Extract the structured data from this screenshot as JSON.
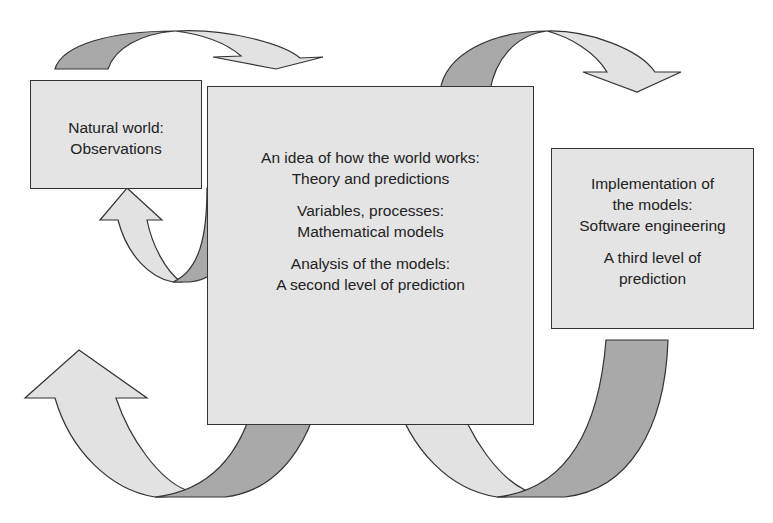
{
  "diagram": {
    "boxes": {
      "natural": {
        "lines": [
          "Natural world:",
          "Observations"
        ]
      },
      "theory": {
        "groups": [
          {
            "lines": [
              "An idea of how the world works:",
              "Theory and predictions"
            ]
          },
          {
            "lines": [
              "Variables, processes:",
              "Mathematical models"
            ]
          },
          {
            "lines": [
              "Analysis of the models:",
              "A second level of prediction"
            ]
          }
        ]
      },
      "implementation": {
        "groups": [
          {
            "lines": [
              "Implementation of",
              "the models:",
              "Software engineering"
            ]
          },
          {
            "lines": [
              "A third level of",
              "prediction"
            ]
          }
        ]
      }
    },
    "arrows": [
      {
        "id": "natural-to-theory",
        "shape": "curved-arrow-over-top"
      },
      {
        "id": "theory-to-implementation",
        "shape": "curved-arrow-over-top"
      },
      {
        "id": "theory-to-natural",
        "shape": "u-turn-arrow-up"
      },
      {
        "id": "theory-to-outside-left",
        "shape": "u-turn-arrow-up"
      },
      {
        "id": "implementation-to-theory",
        "shape": "u-turn-arrow-up"
      }
    ],
    "colors": {
      "box_fill": "#e4e4e4",
      "arrow_light": "#e2e2e2",
      "arrow_dark": "#a9a9a9",
      "stroke": "#333333"
    }
  }
}
